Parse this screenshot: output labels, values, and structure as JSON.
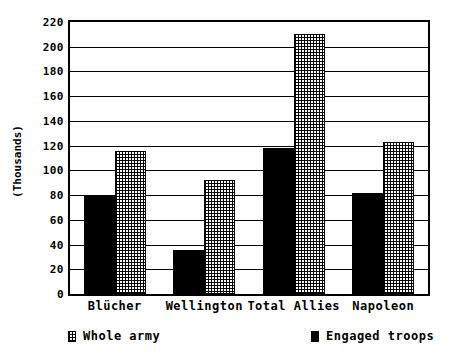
{
  "chart_data": {
    "type": "bar",
    "title": "",
    "subtitle": "",
    "xlabel": "",
    "ylabel": "(Thousands)",
    "categories": [
      "Blücher",
      "Wellington",
      "Total Allies",
      "Napoleon"
    ],
    "series": [
      {
        "name": "Whole army",
        "pattern": "crosshatch",
        "color": "#ffffff",
        "values": [
          116,
          92,
          210,
          123
        ]
      },
      {
        "name": "Engaged troops",
        "pattern": "solid",
        "color": "#000000",
        "values": [
          80,
          36,
          118,
          82
        ]
      }
    ],
    "ylim": [
      0,
      220
    ],
    "ytick_step": 20,
    "yticks": [
      "220",
      "200",
      "180",
      "160",
      "140",
      "120",
      "100",
      "80",
      "60",
      "40",
      "20",
      "0"
    ],
    "ytick_values": [
      220,
      200,
      180,
      160,
      140,
      120,
      100,
      80,
      60,
      40,
      20,
      0
    ],
    "grid": true,
    "grid_axis": "y",
    "legend_position": "bottom",
    "bar_order": [
      "Engaged troops",
      "Whole army"
    ]
  },
  "legend": {
    "whole_army_label": "Whole army",
    "engaged_troops_label": "Engaged troops"
  },
  "axis": {
    "y_title": "(Thousands)"
  }
}
